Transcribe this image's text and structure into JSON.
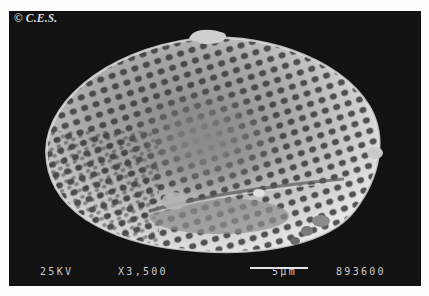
{
  "image": {
    "subject": "SEM micrograph of reticulate pollen grain",
    "copyright": "© C.E.S."
  },
  "sem_info": {
    "voltage": "25KV",
    "magnification": "X3,500",
    "scale_label": "5µm",
    "image_number": "893600"
  },
  "colors": {
    "background": "#121212",
    "grain_light": "#d8d8d8",
    "grain_mid": "#9a9a9a",
    "text": "#c9c9c9"
  }
}
